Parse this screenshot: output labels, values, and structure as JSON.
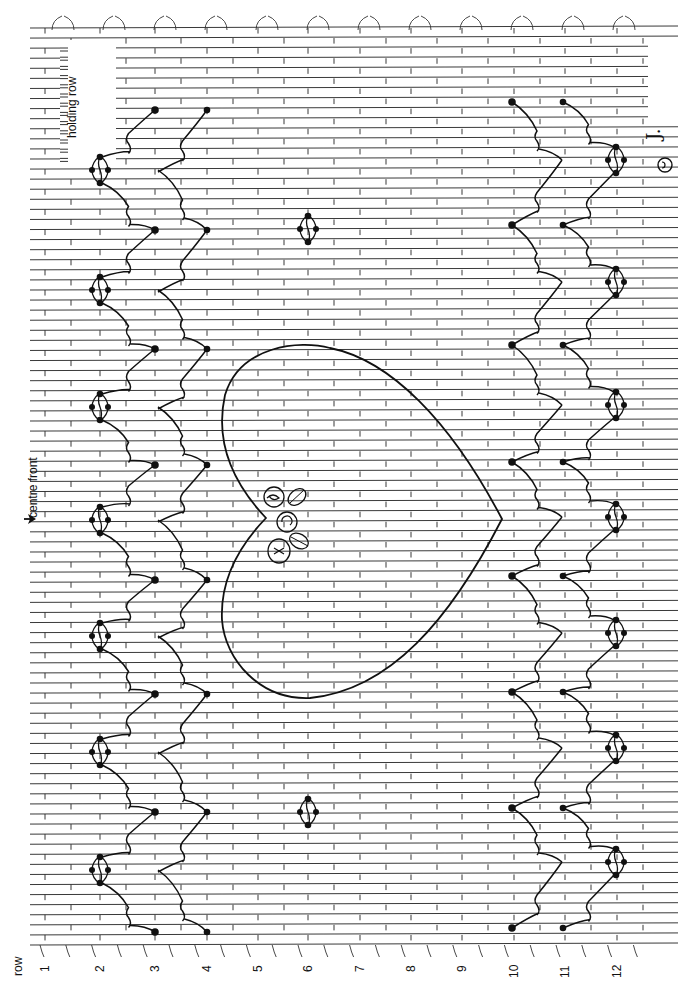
{
  "diagram": {
    "type": "smocking-chart",
    "axis_label": "row",
    "row_labels": [
      "1",
      "2",
      "3",
      "4",
      "5",
      "6",
      "7",
      "8",
      "9",
      "10",
      "11",
      "12"
    ],
    "annotations": {
      "holding_row": "holding row",
      "centre_front": "centre front",
      "signature": "J.",
      "copyright_mark": "©"
    },
    "pleat_line_count": 92,
    "motifs": [
      {
        "name": "wave-chevron-band-left",
        "rows": [
          2,
          3,
          4
        ],
        "description": "cable wave chevrons with diamond knots at row 2, points at rows 3 and 4"
      },
      {
        "name": "heart",
        "rows": [
          4,
          10
        ],
        "description": "large heart outline centred on centre front"
      },
      {
        "name": "rosebud-cluster",
        "rows": [
          5,
          6
        ],
        "description": "bullion roses and leaves at heart cleft"
      },
      {
        "name": "diamond-knots",
        "rows": [
          6
        ],
        "description": "two small diamond knots"
      },
      {
        "name": "wave-chevron-band-right",
        "rows": [
          10,
          11,
          12
        ],
        "description": "cable wave chevrons with diamond knots at row 12, points at rows 10 and 11"
      }
    ]
  }
}
